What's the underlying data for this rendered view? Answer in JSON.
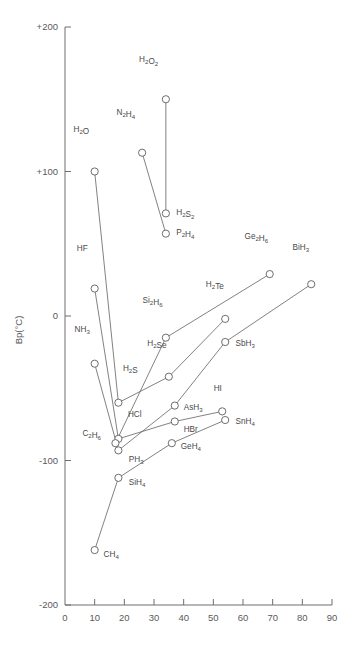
{
  "chart_data": {
    "type": "scatter",
    "title": "",
    "xlabel": "",
    "ylabel": "Bp(°C)",
    "xlim": [
      0,
      90
    ],
    "ylim": [
      -200,
      200
    ],
    "xticks": [
      "0",
      "10",
      "20",
      "30",
      "40",
      "50",
      "60",
      "70",
      "80",
      "90"
    ],
    "yticks": [
      "+200",
      "+100",
      "0",
      "-100",
      "-200"
    ],
    "ytick_values": [
      200,
      100,
      0,
      -100,
      -200
    ],
    "grid": false,
    "legend": "none",
    "points": [
      {
        "label": "H2O2",
        "text": "H₂O₂",
        "x": 34,
        "y": 150,
        "lx": 28.2,
        "ly": 176,
        "anchor": "middle"
      },
      {
        "label": "N2H4",
        "text": "N₂H₄",
        "x": 26,
        "y": 113,
        "lx": 20.5,
        "ly": 139,
        "anchor": "middle"
      },
      {
        "label": "H2O",
        "text": "H₂O",
        "x": 10,
        "y": 100,
        "lx": 5.5,
        "ly": 127,
        "anchor": "middle"
      },
      {
        "label": "H2S2",
        "text": "H₂S₂",
        "x": 34,
        "y": 71,
        "lx": 37.5,
        "ly": 70,
        "anchor": "start"
      },
      {
        "label": "P2H4",
        "text": "P₂H₄",
        "x": 34,
        "y": 57,
        "lx": 37.5,
        "ly": 56,
        "anchor": "start"
      },
      {
        "label": "Ge2H6",
        "text": "Ge₂H₆",
        "x": 69,
        "y": 29,
        "lx": 64.5,
        "ly": 53,
        "anchor": "middle"
      },
      {
        "label": "BiH3",
        "text": "BiH₃",
        "x": 83,
        "y": 22,
        "lx": 79.5,
        "ly": 46,
        "anchor": "middle"
      },
      {
        "label": "HF",
        "text": "HF",
        "x": 10,
        "y": 19,
        "lx": 5.8,
        "ly": 45,
        "anchor": "middle"
      },
      {
        "label": "H2Te",
        "text": "H₂Te",
        "x": 54,
        "y": -2,
        "lx": 50.5,
        "ly": 20,
        "anchor": "middle"
      },
      {
        "label": "Si2H6",
        "text": "Si₂H₆",
        "x": 34,
        "y": -15,
        "lx": 29.5,
        "ly": 9,
        "anchor": "middle"
      },
      {
        "label": "SbH3",
        "text": "SbH₃",
        "x": 54,
        "y": -18,
        "lx": 57.5,
        "ly": -21,
        "anchor": "start"
      },
      {
        "label": "H2Se",
        "text": "H₂Se",
        "x": 35,
        "y": -42,
        "lx": 31.0,
        "ly": -21,
        "anchor": "middle"
      },
      {
        "label": "NH3",
        "text": "NH₃",
        "x": 10,
        "y": -33,
        "lx": 5.8,
        "ly": -11,
        "anchor": "middle"
      },
      {
        "label": "H2S",
        "text": "H₂S",
        "x": 18,
        "y": -60,
        "lx": 22.0,
        "ly": -38,
        "anchor": "middle"
      },
      {
        "label": "AsH3",
        "text": "AsH₃",
        "x": 37,
        "y": -62,
        "lx": 40.0,
        "ly": -65,
        "anchor": "start"
      },
      {
        "label": "HI",
        "text": "HI",
        "x": 53,
        "y": -66,
        "lx": 51.5,
        "ly": -52,
        "anchor": "middle"
      },
      {
        "label": "SnH4",
        "text": "SnH₄",
        "x": 54,
        "y": -72,
        "lx": 57.5,
        "ly": -75,
        "anchor": "start"
      },
      {
        "label": "HBr",
        "text": "HBr",
        "x": 37,
        "y": -73,
        "lx": 40.0,
        "ly": -80,
        "anchor": "start"
      },
      {
        "label": "HCl",
        "text": "HCl",
        "x": 18,
        "y": -85,
        "lx": 23.5,
        "ly": -70,
        "anchor": "middle"
      },
      {
        "label": "C2H6",
        "text": "C₂H₆",
        "x": 17,
        "y": -88,
        "lx": 9.0,
        "ly": -83,
        "anchor": "middle"
      },
      {
        "label": "GeH4",
        "text": "GeH₄",
        "x": 36,
        "y": -88,
        "lx": 39.0,
        "ly": -92,
        "anchor": "start"
      },
      {
        "label": "PH3",
        "text": "PH₃",
        "x": 18,
        "y": -93,
        "lx": 21.5,
        "ly": -101,
        "anchor": "start"
      },
      {
        "label": "SiH4",
        "text": "SiH₄",
        "x": 18,
        "y": -112,
        "lx": 21.5,
        "ly": -117,
        "anchor": "start"
      },
      {
        "label": "CH4",
        "text": "CH₄",
        "x": 10,
        "y": -162,
        "lx": 13.0,
        "ly": -167,
        "anchor": "start"
      }
    ],
    "series": [
      {
        "name": "peroxide-chain",
        "points": [
          "H2O2",
          "H2S2"
        ]
      },
      {
        "name": "hydrazine-chain",
        "points": [
          "N2H4",
          "P2H4"
        ]
      },
      {
        "name": "group16-hydrides",
        "points": [
          "H2O",
          "H2S",
          "H2Se",
          "H2Te"
        ]
      },
      {
        "name": "group17-hydrides",
        "points": [
          "HF",
          "HCl",
          "HBr",
          "HI"
        ]
      },
      {
        "name": "group15-hydrides",
        "points": [
          "NH3",
          "PH3",
          "AsH3",
          "SbH3",
          "BiH3"
        ]
      },
      {
        "name": "group14-hydrides",
        "points": [
          "CH4",
          "SiH4",
          "GeH4",
          "SnH4"
        ]
      },
      {
        "name": "disilane-chain",
        "points": [
          "C2H6",
          "Si2H6",
          "Ge2H6"
        ]
      }
    ]
  }
}
